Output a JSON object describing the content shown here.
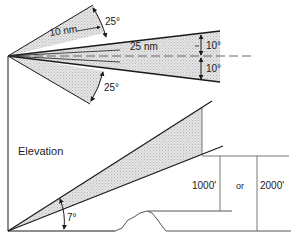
{
  "diagram": {
    "plan": {
      "outer_angle_upper": "25°",
      "outer_angle_lower": "25°",
      "inner_angle_upper": "10°",
      "inner_angle_lower": "10°",
      "short_range": "10 nm",
      "long_range": "25 nm"
    },
    "elevation": {
      "label": "Elevation",
      "glide_angle": "7°",
      "height_low": "1000'",
      "conjunction": "or",
      "height_high": "2000'"
    },
    "colors": {
      "line": "#1a1a1a",
      "shade": "#d9d9d9",
      "background": "#ffffff"
    }
  }
}
